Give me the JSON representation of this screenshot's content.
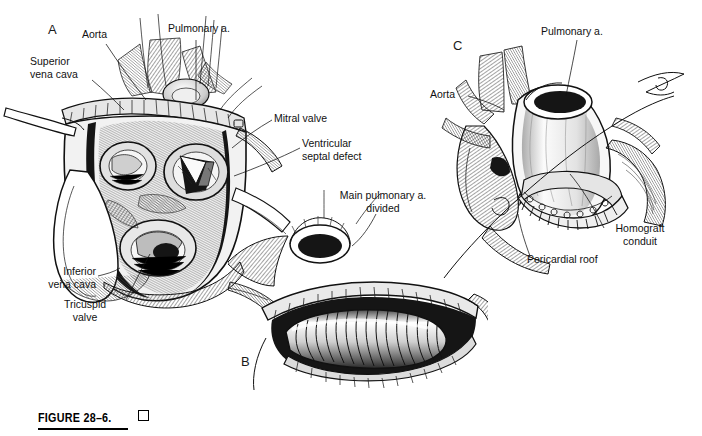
{
  "figure": {
    "caption_number": "FIGURE 28–6.",
    "caption_marker": "square-glyph",
    "ink_color": "#111111",
    "background_color": "#ffffff"
  },
  "panels": [
    {
      "id": "A",
      "letter": "A",
      "labels": [
        {
          "id": "aorta",
          "text": "Aorta"
        },
        {
          "id": "pulmonary-artery",
          "text": "Pulmonary a."
        },
        {
          "id": "superior-vena-cava",
          "text": "Superior\nvena cava"
        },
        {
          "id": "mitral-valve",
          "text": "Mitral valve"
        },
        {
          "id": "ventricular-septal-defect",
          "text": "Ventricular\nseptal defect"
        },
        {
          "id": "inferior-vena-cava",
          "text": "Inferior\nvena cava"
        },
        {
          "id": "tricuspid-valve",
          "text": "Tricuspid\nvalve"
        }
      ]
    },
    {
      "id": "B",
      "letter": "B",
      "labels": [
        {
          "id": "main-pulmonary-artery-divided",
          "text": "Main pulmonary a.\ndivided"
        }
      ]
    },
    {
      "id": "C",
      "letter": "C",
      "labels": [
        {
          "id": "pulmonary-artery",
          "text": "Pulmonary a."
        },
        {
          "id": "aorta",
          "text": "Aorta"
        },
        {
          "id": "homograft-conduit",
          "text": "Homograft\nconduit"
        },
        {
          "id": "pericardial-roof",
          "text": "Pericardial roof"
        }
      ]
    }
  ]
}
